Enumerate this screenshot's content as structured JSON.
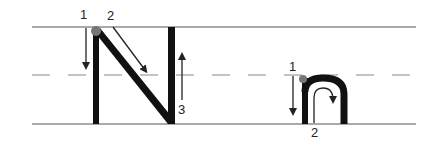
{
  "diagram": {
    "guide_lines": {
      "top": "solid",
      "middle": "dashed",
      "bottom": "solid",
      "color": "#555555"
    },
    "letters": [
      {
        "glyph": "N",
        "strokes": [
          {
            "number": "1",
            "direction": "down"
          },
          {
            "number": "2",
            "direction": "diagonal down-right"
          },
          {
            "number": "3",
            "direction": "up"
          }
        ]
      },
      {
        "glyph": "n",
        "strokes": [
          {
            "number": "1",
            "direction": "down"
          },
          {
            "number": "2",
            "direction": "up, over and down"
          }
        ]
      }
    ],
    "colors": {
      "stroke": "#111111",
      "start_dot": "#777777",
      "arrow": "#222222"
    }
  }
}
